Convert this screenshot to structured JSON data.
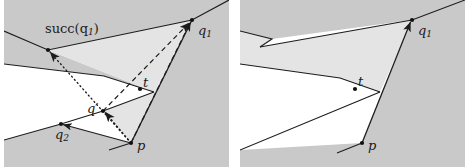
{
  "figure": {
    "width": 471,
    "height": 167,
    "background": "#ffffff",
    "panel_count": 2
  },
  "colors": {
    "outer_shade": "#c9c9c9",
    "inner_shade": "#e4e4e4",
    "free_space": "#ffffff",
    "stroke": "#1c1c1c",
    "label": "#1a1a1a",
    "vertex_dot": "#111111"
  },
  "labels": {
    "succ_q1": "succ(q",
    "succ_q1_sub": "1",
    "succ_q1_close": ")",
    "q1": "q",
    "q1_sub": "1",
    "q2": "q",
    "q2_sub": "2",
    "q_prime": "q",
    "q_prime_mark": "′",
    "p": "p",
    "t": "t"
  },
  "panels": [
    {
      "name": "left-panel",
      "caption": "",
      "labels_shown": [
        "succ(q1)",
        "q1",
        "q2",
        "q′",
        "p",
        "t"
      ],
      "vertices": [
        {
          "name": "q1",
          "x": 188,
          "y": 20
        },
        {
          "name": "q2",
          "x": 57,
          "y": 124
        },
        {
          "name": "q_prime",
          "x": 99,
          "y": 111
        },
        {
          "name": "p",
          "x": 127,
          "y": 143
        },
        {
          "name": "t",
          "x": 136,
          "y": 89
        },
        {
          "name": "succ_q1",
          "x": 44,
          "y": 50
        }
      ],
      "edges": [
        {
          "from": "p",
          "to": "q1",
          "style": "dashed",
          "arrow": true
        },
        {
          "from": "p",
          "to": "succ_q1",
          "style": "dotted",
          "arrow": true
        },
        {
          "from": "p",
          "to": "q2",
          "style": "solid",
          "arrow": true
        },
        {
          "from": "p",
          "to": "q_prime",
          "style": "dotted",
          "arrow": true
        },
        {
          "from": "q_prime",
          "to": "q1",
          "style": "dashed",
          "arrow": true
        }
      ]
    },
    {
      "name": "right-panel",
      "caption": "",
      "labels_shown": [
        "q1",
        "p",
        "t"
      ],
      "vertices": [
        {
          "name": "q1",
          "x": 172,
          "y": 20
        },
        {
          "name": "p",
          "x": 122,
          "y": 143
        },
        {
          "name": "t",
          "x": 115,
          "y": 89
        }
      ],
      "edges": [
        {
          "from": "p",
          "to": "q1",
          "style": "solid",
          "arrow": true
        }
      ]
    }
  ]
}
